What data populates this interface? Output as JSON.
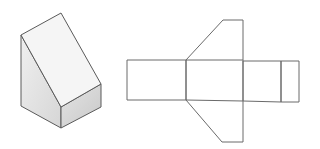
{
  "figure": {
    "description": "Isometric view of a wedge-shaped prism and its unfolded net",
    "solid": {
      "label": "wedge-prism-3d",
      "colors": {
        "slope_face": "#f5f5f5",
        "side_face_light": "#eeeeee",
        "side_face_dark": "#d8d8d8",
        "front_face_light": "#e2e2e2",
        "front_face_dark": "#c9c9c9",
        "edge": "#5a5a5a"
      },
      "vertices": {
        "apex": [
          61,
          13
        ],
        "left_top": [
          21,
          35
        ],
        "left_bottom": [
          21,
          106
        ],
        "front_top": [
          61,
          107
        ],
        "front_bottom": [
          61,
          128
        ],
        "right_top": [
          101,
          84
        ],
        "right_bottom": [
          101,
          107
        ]
      }
    },
    "net": {
      "label": "wedge-prism-net",
      "stroke": "#6a6a6a",
      "faces": [
        {
          "name": "back-rect",
          "points": "127,60 186,60 186,100 127,100"
        },
        {
          "name": "slope-rect",
          "points": "186,60 243,60 243,101 186,100"
        },
        {
          "name": "bottom-rect",
          "points": "243,61 281,61 281,102 243,101"
        },
        {
          "name": "front-rect",
          "points": "281,61 299,61 299,102 281,102"
        },
        {
          "name": "top-side-trapezoid",
          "points": "186,60 223,20 243,20 243,60"
        },
        {
          "name": "bottom-side-trapezoid",
          "points": "186,100 222,142 243,142 243,101"
        }
      ]
    }
  }
}
